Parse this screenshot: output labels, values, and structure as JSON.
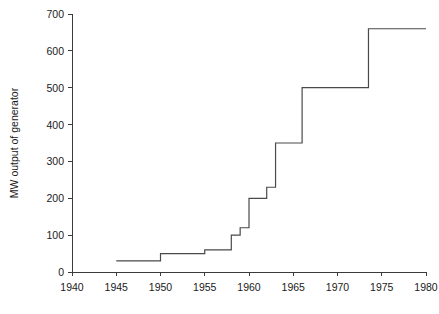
{
  "chart_data": {
    "type": "line",
    "subtype": "step",
    "title": "",
    "xlabel": "",
    "ylabel": "MW output of generator",
    "xlim": [
      1940,
      1980
    ],
    "ylim": [
      0,
      700
    ],
    "grid": false,
    "legend": false,
    "xticks": [
      1940,
      1945,
      1950,
      1955,
      1960,
      1965,
      1970,
      1975,
      1980
    ],
    "xtick_labels": [
      "1940",
      "1945",
      "1950",
      "1955",
      "1960",
      "1965",
      "1970",
      "1975",
      "1980"
    ],
    "yticks": [
      0,
      100,
      200,
      300,
      400,
      500,
      600,
      700
    ],
    "ytick_labels": [
      "0",
      "100",
      "200",
      "300",
      "400",
      "500",
      "600",
      "700"
    ],
    "series": [
      {
        "name": "MW output of generator",
        "color": "#4a4a4a",
        "x": [
          1945,
          1950,
          1955,
          1958,
          1959,
          1960,
          1962,
          1963,
          1966,
          1973.5,
          1980
        ],
        "values": [
          30,
          50,
          60,
          100,
          120,
          200,
          230,
          350,
          500,
          660,
          660
        ],
        "steps": [
          {
            "year_start": 1945,
            "year_end": 1950,
            "mw": 30
          },
          {
            "year_start": 1950,
            "year_end": 1955,
            "mw": 50
          },
          {
            "year_start": 1955,
            "year_end": 1958,
            "mw": 60
          },
          {
            "year_start": 1958,
            "year_end": 1959,
            "mw": 100
          },
          {
            "year_start": 1959,
            "year_end": 1960,
            "mw": 120
          },
          {
            "year_start": 1960,
            "year_end": 1962,
            "mw": 200
          },
          {
            "year_start": 1962,
            "year_end": 1963,
            "mw": 230
          },
          {
            "year_start": 1963,
            "year_end": 1966,
            "mw": 350
          },
          {
            "year_start": 1966,
            "year_end": 1973.5,
            "mw": 500
          },
          {
            "year_start": 1973.5,
            "year_end": 1980,
            "mw": 660
          }
        ]
      }
    ]
  }
}
